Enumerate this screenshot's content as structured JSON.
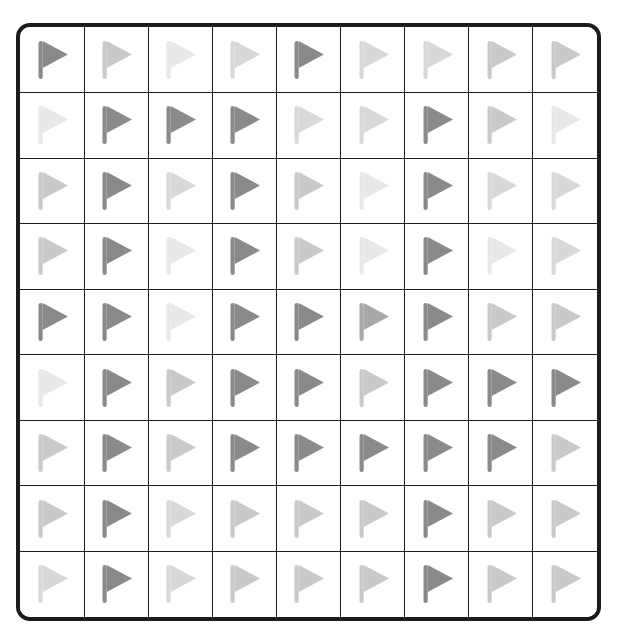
{
  "panel": {
    "name": "flag-grid",
    "rows": 9,
    "columns": 9,
    "border_color": "#1c1c1c",
    "cell_background": "#ffffff",
    "page_background": "#ffffff"
  },
  "icon": {
    "semantic_name": "flag-icon",
    "shape": "right-pointing triangular pennant on vertical pole"
  },
  "palette": {
    "dark": "#8a8a8a",
    "medium": "#a8a8a8",
    "light": "#c9c9c9",
    "lighter": "#d8d8d8",
    "lightest": "#e8e8e8"
  },
  "chart_data": {
    "type": "heatmap",
    "title": "",
    "xlabel": "",
    "ylabel": "",
    "categories": [
      "1",
      "2",
      "3",
      "4",
      "5",
      "6",
      "7",
      "8",
      "9"
    ],
    "row_labels": [
      "1",
      "2",
      "3",
      "4",
      "5",
      "6",
      "7",
      "8",
      "9"
    ],
    "grid": true,
    "legend": "none",
    "cells": [
      [
        {
          "shade": "dark",
          "color": "#8a8a8a"
        },
        {
          "shade": "light",
          "color": "#c9c9c9"
        },
        {
          "shade": "lightest",
          "color": "#e8e8e8"
        },
        {
          "shade": "lighter",
          "color": "#d8d8d8"
        },
        {
          "shade": "dark",
          "color": "#8a8a8a"
        },
        {
          "shade": "lighter",
          "color": "#d8d8d8"
        },
        {
          "shade": "lighter",
          "color": "#d8d8d8"
        },
        {
          "shade": "light",
          "color": "#c9c9c9"
        },
        {
          "shade": "light",
          "color": "#c9c9c9"
        }
      ],
      [
        {
          "shade": "lightest",
          "color": "#e8e8e8"
        },
        {
          "shade": "dark",
          "color": "#8a8a8a"
        },
        {
          "shade": "dark",
          "color": "#8a8a8a"
        },
        {
          "shade": "dark",
          "color": "#8a8a8a"
        },
        {
          "shade": "lighter",
          "color": "#d8d8d8"
        },
        {
          "shade": "lighter",
          "color": "#d8d8d8"
        },
        {
          "shade": "dark",
          "color": "#8a8a8a"
        },
        {
          "shade": "light",
          "color": "#c9c9c9"
        },
        {
          "shade": "lightest",
          "color": "#e8e8e8"
        }
      ],
      [
        {
          "shade": "light",
          "color": "#c9c9c9"
        },
        {
          "shade": "dark",
          "color": "#8a8a8a"
        },
        {
          "shade": "lighter",
          "color": "#d8d8d8"
        },
        {
          "shade": "dark",
          "color": "#8a8a8a"
        },
        {
          "shade": "light",
          "color": "#c9c9c9"
        },
        {
          "shade": "lightest",
          "color": "#e8e8e8"
        },
        {
          "shade": "dark",
          "color": "#8a8a8a"
        },
        {
          "shade": "lighter",
          "color": "#d8d8d8"
        },
        {
          "shade": "lighter",
          "color": "#d8d8d8"
        }
      ],
      [
        {
          "shade": "light",
          "color": "#c9c9c9"
        },
        {
          "shade": "dark",
          "color": "#8a8a8a"
        },
        {
          "shade": "lightest",
          "color": "#e8e8e8"
        },
        {
          "shade": "dark",
          "color": "#8a8a8a"
        },
        {
          "shade": "light",
          "color": "#c9c9c9"
        },
        {
          "shade": "lightest",
          "color": "#e8e8e8"
        },
        {
          "shade": "dark",
          "color": "#8a8a8a"
        },
        {
          "shade": "lightest",
          "color": "#e8e8e8"
        },
        {
          "shade": "lighter",
          "color": "#d8d8d8"
        }
      ],
      [
        {
          "shade": "dark",
          "color": "#8a8a8a"
        },
        {
          "shade": "dark",
          "color": "#8a8a8a"
        },
        {
          "shade": "lightest",
          "color": "#e8e8e8"
        },
        {
          "shade": "dark",
          "color": "#8a8a8a"
        },
        {
          "shade": "dark",
          "color": "#8a8a8a"
        },
        {
          "shade": "medium",
          "color": "#a8a8a8"
        },
        {
          "shade": "dark",
          "color": "#8a8a8a"
        },
        {
          "shade": "light",
          "color": "#c9c9c9"
        },
        {
          "shade": "light",
          "color": "#c9c9c9"
        }
      ],
      [
        {
          "shade": "lightest",
          "color": "#e8e8e8"
        },
        {
          "shade": "dark",
          "color": "#8a8a8a"
        },
        {
          "shade": "light",
          "color": "#c9c9c9"
        },
        {
          "shade": "dark",
          "color": "#8a8a8a"
        },
        {
          "shade": "dark",
          "color": "#8a8a8a"
        },
        {
          "shade": "light",
          "color": "#c9c9c9"
        },
        {
          "shade": "dark",
          "color": "#8a8a8a"
        },
        {
          "shade": "dark",
          "color": "#8a8a8a"
        },
        {
          "shade": "dark",
          "color": "#8a8a8a"
        }
      ],
      [
        {
          "shade": "light",
          "color": "#c9c9c9"
        },
        {
          "shade": "dark",
          "color": "#8a8a8a"
        },
        {
          "shade": "light",
          "color": "#c9c9c9"
        },
        {
          "shade": "dark",
          "color": "#8a8a8a"
        },
        {
          "shade": "dark",
          "color": "#8a8a8a"
        },
        {
          "shade": "dark",
          "color": "#8a8a8a"
        },
        {
          "shade": "dark",
          "color": "#8a8a8a"
        },
        {
          "shade": "dark",
          "color": "#8a8a8a"
        },
        {
          "shade": "light",
          "color": "#c9c9c9"
        }
      ],
      [
        {
          "shade": "light",
          "color": "#c9c9c9"
        },
        {
          "shade": "dark",
          "color": "#8a8a8a"
        },
        {
          "shade": "lighter",
          "color": "#d8d8d8"
        },
        {
          "shade": "light",
          "color": "#c9c9c9"
        },
        {
          "shade": "light",
          "color": "#c9c9c9"
        },
        {
          "shade": "light",
          "color": "#c9c9c9"
        },
        {
          "shade": "dark",
          "color": "#8a8a8a"
        },
        {
          "shade": "light",
          "color": "#c9c9c9"
        },
        {
          "shade": "light",
          "color": "#c9c9c9"
        }
      ],
      [
        {
          "shade": "lighter",
          "color": "#d8d8d8"
        },
        {
          "shade": "dark",
          "color": "#8a8a8a"
        },
        {
          "shade": "lighter",
          "color": "#d8d8d8"
        },
        {
          "shade": "light",
          "color": "#c9c9c9"
        },
        {
          "shade": "light",
          "color": "#c9c9c9"
        },
        {
          "shade": "light",
          "color": "#c9c9c9"
        },
        {
          "shade": "dark",
          "color": "#8a8a8a"
        },
        {
          "shade": "light",
          "color": "#c9c9c9"
        },
        {
          "shade": "light",
          "color": "#c9c9c9"
        }
      ]
    ]
  }
}
